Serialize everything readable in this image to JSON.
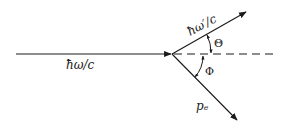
{
  "diagram": {
    "type": "compton-scattering-vector-diagram",
    "incoming_photon": {
      "label": "ħω/c"
    },
    "scattered_photon": {
      "label": "ħω′/c"
    },
    "electron": {
      "label": "pₑ"
    },
    "angles": {
      "theta": "Θ",
      "phi": "Φ"
    },
    "colors": {
      "line": "#1a1a1a",
      "background": "#ffffff"
    }
  }
}
